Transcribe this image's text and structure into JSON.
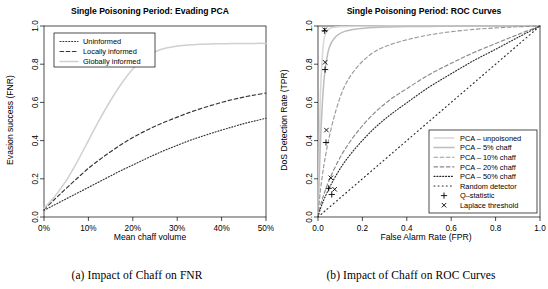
{
  "figure": {
    "panels": [
      {
        "id": "panel-a",
        "caption": "(a) Impact of Chaff on FNR",
        "chart_data": {
          "type": "line",
          "title": "Single Poisoning Period: Evading PCA",
          "xlabel": "Mean chaff volume",
          "ylabel": "Evasion success (FNR)",
          "xlim": [
            0,
            50
          ],
          "ylim": [
            0,
            1
          ],
          "xticks": [
            0,
            10,
            20,
            30,
            40,
            50
          ],
          "xticklabels": [
            "0%",
            "10%",
            "20%",
            "30%",
            "40%",
            "50%"
          ],
          "yticks": [
            0.0,
            0.2,
            0.4,
            0.6,
            0.8,
            1.0
          ],
          "yticklabels": [
            "0.0",
            "0.2",
            "0.4",
            "0.6",
            "0.8",
            "1.0"
          ],
          "grid": false,
          "legend_position": "top-left",
          "x": [
            0,
            2.5,
            5,
            7.5,
            10,
            12.5,
            15,
            17.5,
            20,
            22.5,
            25,
            27.5,
            30,
            32.5,
            35,
            37.5,
            40,
            42.5,
            45,
            47.5,
            50
          ],
          "series": [
            {
              "name": "Uninformed",
              "style": "dotted",
              "color": "#333333",
              "values": [
                0.035,
                0.065,
                0.095,
                0.125,
                0.155,
                0.185,
                0.215,
                0.245,
                0.272,
                0.3,
                0.327,
                0.352,
                0.375,
                0.398,
                0.418,
                0.437,
                0.455,
                0.472,
                0.489,
                0.503,
                0.517
              ]
            },
            {
              "name": "Locally informed",
              "style": "dashed",
              "color": "#333333",
              "values": [
                0.04,
                0.095,
                0.15,
                0.203,
                0.255,
                0.3,
                0.342,
                0.381,
                0.416,
                0.447,
                0.475,
                0.5,
                0.523,
                0.545,
                0.565,
                0.583,
                0.6,
                0.615,
                0.628,
                0.639,
                0.649
              ]
            },
            {
              "name": "Globally informed",
              "style": "solid",
              "color": "#d0d0d0",
              "values": [
                0.045,
                0.11,
                0.19,
                0.29,
                0.4,
                0.51,
                0.61,
                0.7,
                0.775,
                0.83,
                0.865,
                0.885,
                0.895,
                0.901,
                0.904,
                0.906,
                0.907,
                0.908,
                0.908,
                0.909,
                0.909
              ]
            }
          ]
        }
      },
      {
        "id": "panel-b",
        "caption": "(b) Impact of Chaff on ROC Curves",
        "chart_data": {
          "type": "line",
          "title": "Single Poisoning Period: ROC Curves",
          "xlabel": "False Alarm Rate (FPR)",
          "ylabel": "DoS Detection Rate (TPR)",
          "xlim": [
            0,
            1
          ],
          "ylim": [
            0,
            1
          ],
          "xticks": [
            0.0,
            0.2,
            0.4,
            0.6,
            0.8,
            1.0
          ],
          "xticklabels": [
            "0.0",
            "0.2",
            "0.4",
            "0.6",
            "0.8",
            "1.0"
          ],
          "yticks": [
            0.0,
            0.2,
            0.4,
            0.6,
            0.8,
            1.0
          ],
          "yticklabels": [
            "0.0",
            "0.2",
            "0.4",
            "0.6",
            "0.8",
            "1.0"
          ],
          "grid": false,
          "legend_position": "bottom-right",
          "x": [
            0,
            0.01,
            0.02,
            0.03,
            0.05,
            0.08,
            0.12,
            0.18,
            0.25,
            0.32,
            0.4,
            0.5,
            0.6,
            0.7,
            0.8,
            0.9,
            1.0
          ],
          "series": [
            {
              "name": "PCA – unpoisoned",
              "style": "solid",
              "color": "#d8d8d8",
              "values": [
                0.0,
                0.6,
                0.85,
                0.945,
                0.985,
                0.995,
                0.998,
                0.999,
                0.999,
                1.0,
                1.0,
                1.0,
                1.0,
                1.0,
                1.0,
                1.0,
                1.0
              ]
            },
            {
              "name": "PCA – 5% chaff",
              "style": "solid",
              "color": "#bdbdbd",
              "values": [
                0.0,
                0.36,
                0.6,
                0.75,
                0.885,
                0.945,
                0.972,
                0.985,
                0.992,
                0.995,
                0.997,
                0.998,
                0.999,
                1.0,
                1.0,
                1.0,
                1.0
              ]
            },
            {
              "name": "PCA – 10% chaff",
              "style": "dashed",
              "color": "#9a9a9a",
              "values": [
                0.0,
                0.13,
                0.22,
                0.295,
                0.415,
                0.555,
                0.685,
                0.79,
                0.862,
                0.9,
                0.928,
                0.953,
                0.97,
                0.982,
                0.99,
                0.996,
                1.0
              ]
            },
            {
              "name": "PCA – 20% chaff",
              "style": "dashed",
              "color": "#8a8a8a",
              "values": [
                0.0,
                0.055,
                0.095,
                0.13,
                0.192,
                0.268,
                0.352,
                0.45,
                0.54,
                0.61,
                0.672,
                0.745,
                0.805,
                0.86,
                0.908,
                0.955,
                1.0
              ]
            },
            {
              "name": "PCA – 50% chaff",
              "style": "dotted",
              "color": "#2b2b2b",
              "values": [
                0.0,
                0.04,
                0.072,
                0.1,
                0.15,
                0.215,
                0.288,
                0.375,
                0.46,
                0.53,
                0.598,
                0.68,
                0.75,
                0.818,
                0.878,
                0.94,
                1.0
              ]
            },
            {
              "name": "Random detector",
              "style": "dotted-sparse",
              "color": "#2b2b2b",
              "values": [
                0.0,
                0.01,
                0.02,
                0.03,
                0.05,
                0.08,
                0.12,
                0.18,
                0.25,
                0.32,
                0.4,
                0.5,
                0.6,
                0.7,
                0.8,
                0.9,
                1.0
              ]
            }
          ],
          "markers": [
            {
              "label": "Q–statistic",
              "symbol": "+",
              "points": [
                [
                  0.03,
                  0.975
                ],
                [
                  0.032,
                  0.772
                ],
                [
                  0.036,
                  0.39
                ],
                [
                  0.048,
                  0.15
                ],
                [
                  0.062,
                  0.118
                ]
              ]
            },
            {
              "label": "Laplace threshold",
              "symbol": "×",
              "points": [
                [
                  0.03,
                  0.98
                ],
                [
                  0.032,
                  0.81
                ],
                [
                  0.038,
                  0.455
                ],
                [
                  0.058,
                  0.205
                ],
                [
                  0.075,
                  0.145
                ]
              ]
            }
          ],
          "legend_entries": [
            {
              "label": "PCA – unpoisoned",
              "style": "solid",
              "color": "#d8d8d8"
            },
            {
              "label": "PCA – 5% chaff",
              "style": "solid",
              "color": "#bdbdbd"
            },
            {
              "label": "PCA – 10% chaff",
              "style": "dashed",
              "color": "#9a9a9a"
            },
            {
              "label": "PCA – 20% chaff",
              "style": "dashed",
              "color": "#8a8a8a"
            },
            {
              "label": "PCA – 50% chaff",
              "style": "dotted",
              "color": "#2b2b2b"
            },
            {
              "label": "Random detector",
              "style": "dotted-sparse",
              "color": "#2b2b2b"
            },
            {
              "label": "Q–statistic",
              "style": "marker-plus",
              "color": "#000000"
            },
            {
              "label": "Laplace threshold",
              "style": "marker-cross",
              "color": "#000000"
            }
          ]
        }
      }
    ]
  }
}
